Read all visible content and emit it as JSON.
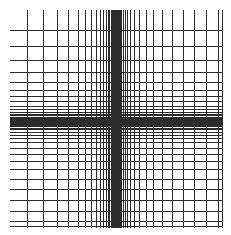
{
  "figure": {
    "background_color": "#ffffff",
    "width": 231,
    "height": 235
  },
  "chart_data": {
    "type": "line",
    "title": "",
    "subtitle": "",
    "xlabel": "",
    "ylabel": "",
    "grid": true,
    "legend": null,
    "line_color": "#2b2b2b",
    "line_width": 1,
    "xlim": [
      27,
      222
    ],
    "ylim": [
      30,
      226
    ],
    "x_center": 115,
    "y_center": 118,
    "vertical_line_count": 41,
    "horizontal_line_count": 41,
    "vertical_span": [
      10,
      228
    ],
    "horizontal_span": [
      10,
      222
    ],
    "vertical_lines": [
      27,
      43.5,
      57,
      68.5,
      78,
      85.5,
      91.5,
      96.5,
      100.5,
      103.5,
      106,
      108,
      109.6,
      111,
      112.1,
      113.1,
      114,
      114.8,
      115.6,
      116.4,
      117.2,
      118.1,
      119.1,
      120.2,
      121.6,
      123.2,
      125.2,
      127.7,
      130.9,
      134.9,
      139.9,
      146,
      153.4,
      162.1,
      172,
      183,
      194.8,
      206.9,
      218.6,
      222,
      222
    ],
    "horizontal_lines": [
      30,
      46,
      60,
      72,
      82,
      90,
      96.5,
      101.8,
      106,
      109.4,
      112.1,
      114.2,
      115.9,
      117.3,
      118.5,
      119.5,
      120.4,
      121.3,
      122.2,
      123.1,
      124.1,
      125.2,
      126.5,
      128,
      129.9,
      132.2,
      135,
      138.5,
      142.8,
      148,
      154.2,
      161.4,
      169.7,
      179,
      189.2,
      200,
      211,
      221.5,
      226,
      226,
      226
    ]
  },
  "labels": {
    "plot_area": "grid-plot-area",
    "vertical_group": "vertical-grid-lines",
    "horizontal_group": "horizontal-grid-lines"
  }
}
